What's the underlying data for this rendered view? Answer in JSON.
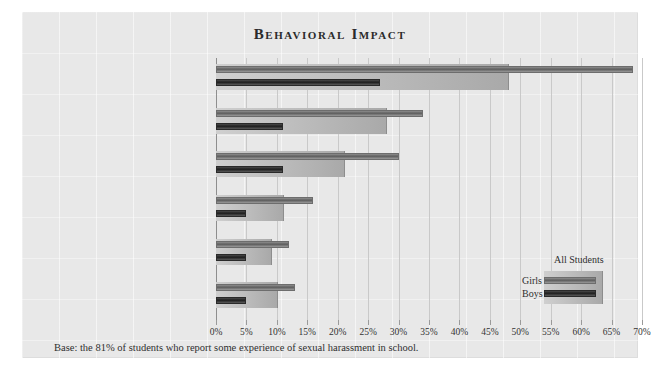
{
  "chart_data": {
    "type": "bar",
    "orientation": "horizontal",
    "title": "Behavioral Impact",
    "xlabel": "",
    "ylabel": "",
    "xlim": [
      0,
      70
    ],
    "xticks": [
      "0%",
      "5%",
      "10%",
      "15%",
      "20%",
      "25%",
      "30%",
      "35%",
      "40%",
      "45%",
      "50%",
      "55%",
      "60%",
      "65%",
      "70%"
    ],
    "xtick_values": [
      0,
      5,
      10,
      15,
      20,
      25,
      30,
      35,
      40,
      45,
      50,
      55,
      60,
      65,
      70
    ],
    "grid": true,
    "legend_position": "bottom-right",
    "categories": [
      "Avoiding the Person Who Bothered/Harassed You",
      "Staying Away from Particular Places in the School or on the School Grounds",
      "Changing Your Seat in Class to Get Farther Away from Someone",
      "Stopping Attending a Particular Activity or Sport",
      "Changing Your Group of Friends",
      "Changing the Way You Come to or Go Home from School"
    ],
    "series": [
      {
        "name": "All Students",
        "color": "#bcbcbc",
        "values": [
          48,
          28,
          21,
          11,
          9,
          10
        ]
      },
      {
        "name": "Girls",
        "color": "#6d6d6d",
        "values": [
          68.5,
          34,
          30,
          16,
          12,
          13
        ]
      },
      {
        "name": "Boys",
        "color": "#262626",
        "values": [
          27,
          11,
          11,
          5,
          5,
          5
        ]
      }
    ],
    "footnote": "Base: the 81% of students who report some experience of sexual harassment in school."
  },
  "legend": {
    "all_students": "All Students",
    "girls": "Girls",
    "boys": "Boys"
  }
}
